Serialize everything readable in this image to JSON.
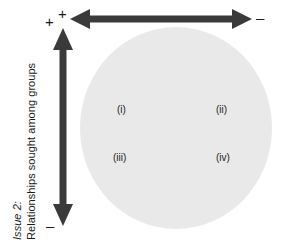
{
  "figure": {
    "axis_caption": {
      "issue_label": "Issue 2:",
      "dimension_label": "Relationships sought among groups"
    },
    "horizontal_axis": {
      "positive_sign": "+",
      "negative_sign": "–",
      "arrow_icon": "double-headed-arrow-horizontal"
    },
    "vertical_axis": {
      "positive_sign": "+",
      "negative_sign": "–",
      "arrow_icon": "double-headed-arrow-vertical"
    },
    "field": {
      "shape": "circle",
      "fill_color": "#e9e9e9"
    },
    "quadrants": [
      {
        "id": "i",
        "label": "(i)"
      },
      {
        "id": "ii",
        "label": "(ii)"
      },
      {
        "id": "iii",
        "label": "(iii)"
      },
      {
        "id": "iv",
        "label": "(iv)"
      }
    ],
    "colors": {
      "ink": "#1a1a1a",
      "arrow": "#3a3a3a",
      "field": "#e9e9e9",
      "background": "#ffffff"
    }
  }
}
